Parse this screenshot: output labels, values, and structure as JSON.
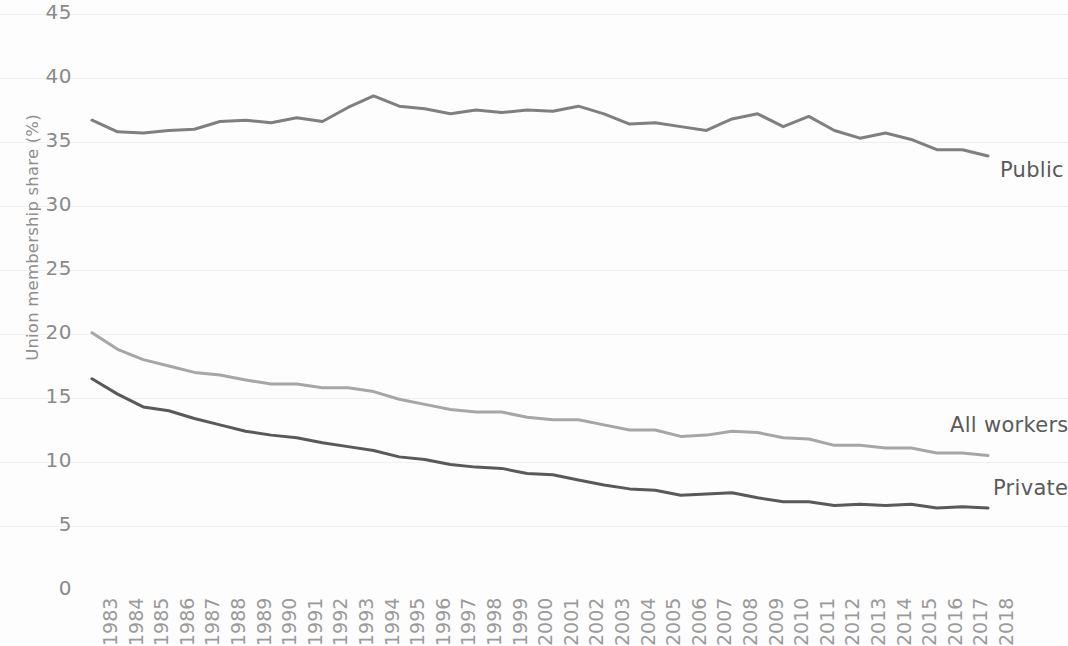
{
  "chart_data": {
    "type": "line",
    "title": "",
    "xlabel": "",
    "ylabel": "Union membership share (%)",
    "ylim": [
      0,
      45
    ],
    "xlim": [
      1983,
      2018
    ],
    "yticks": [
      0,
      5,
      10,
      15,
      20,
      25,
      30,
      35,
      40,
      45
    ],
    "ytick_labels": [
      "0",
      "5",
      "10",
      "15",
      "20",
      "25",
      "30",
      "35",
      "40",
      "45"
    ],
    "grid": false,
    "legend_position": "inline-right-of-line-ends",
    "x": [
      1983,
      1984,
      1985,
      1986,
      1987,
      1988,
      1989,
      1990,
      1991,
      1992,
      1993,
      1994,
      1995,
      1996,
      1997,
      1998,
      1999,
      2000,
      2001,
      2002,
      2003,
      2004,
      2005,
      2006,
      2007,
      2008,
      2009,
      2010,
      2011,
      2012,
      2013,
      2014,
      2015,
      2016,
      2017,
      2018
    ],
    "categories": [
      "1983",
      "1984",
      "1985",
      "1986",
      "1987",
      "1988",
      "1989",
      "1990",
      "1991",
      "1992",
      "1993",
      "1994",
      "1995",
      "1996",
      "1997",
      "1998",
      "1999",
      "2000",
      "2001",
      "2002",
      "2003",
      "2004",
      "2005",
      "2006",
      "2007",
      "2008",
      "2009",
      "2010",
      "2011",
      "2012",
      "2013",
      "2014",
      "2015",
      "2016",
      "2017",
      "2018"
    ],
    "series": [
      {
        "name": "Public",
        "label": "Public",
        "color": "#7f7f7f",
        "values": [
          36.7,
          35.8,
          35.7,
          35.9,
          36.0,
          36.6,
          36.7,
          36.5,
          36.9,
          36.6,
          37.7,
          38.6,
          37.8,
          37.6,
          37.2,
          37.5,
          37.3,
          37.5,
          37.4,
          37.8,
          37.2,
          36.4,
          36.5,
          36.2,
          35.9,
          36.8,
          37.2,
          36.2,
          37.0,
          35.9,
          35.3,
          35.7,
          35.2,
          34.4,
          34.4,
          33.9
        ]
      },
      {
        "name": "All workers",
        "label": "All workers",
        "color": "#a6a6a6",
        "values": [
          20.1,
          18.8,
          18.0,
          17.5,
          17.0,
          16.8,
          16.4,
          16.1,
          16.1,
          15.8,
          15.8,
          15.5,
          14.9,
          14.5,
          14.1,
          13.9,
          13.9,
          13.5,
          13.3,
          13.3,
          12.9,
          12.5,
          12.5,
          12.0,
          12.1,
          12.4,
          12.3,
          11.9,
          11.8,
          11.3,
          11.3,
          11.1,
          11.1,
          10.7,
          10.7,
          10.5
        ]
      },
      {
        "name": "Private",
        "label": "Private",
        "color": "#595959",
        "values": [
          16.5,
          15.3,
          14.3,
          14.0,
          13.4,
          12.9,
          12.4,
          12.1,
          11.9,
          11.5,
          11.2,
          10.9,
          10.4,
          10.2,
          9.8,
          9.6,
          9.5,
          9.1,
          9.0,
          8.6,
          8.2,
          7.9,
          7.8,
          7.4,
          7.5,
          7.6,
          7.2,
          6.9,
          6.9,
          6.6,
          6.7,
          6.6,
          6.7,
          6.4,
          6.5,
          6.4
        ]
      }
    ]
  },
  "labels": {
    "public": "Public",
    "all_workers": "All workers",
    "private": "Private"
  }
}
